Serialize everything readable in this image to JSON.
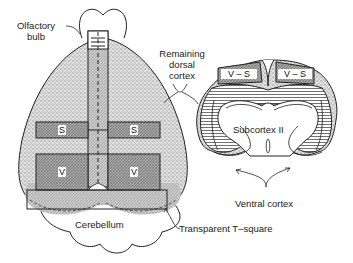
{
  "figure": {
    "left_view": {
      "labels": {
        "olfactory_bulb_line1": "Olfactory",
        "olfactory_bulb_line2": "bulb",
        "cerebellum": "Cerebellum",
        "transparent_t_square": "Transparent T–square"
      },
      "regions": {
        "s_left": "S",
        "s_right": "S",
        "v_left": "V",
        "v_right": "V"
      }
    },
    "shared_labels": {
      "remaining_dorsal_cortex_line1": "Remaining",
      "remaining_dorsal_cortex_line2": "dorsal",
      "remaining_dorsal_cortex_line3": "cortex"
    },
    "right_view": {
      "labels": {
        "subcortex": "Subcortex II",
        "ventral_cortex": "Ventral cortex"
      },
      "regions": {
        "vs_left": "V – S",
        "vs_right": "V – S"
      }
    },
    "colors": {
      "outline": "#222222",
      "stipple": "#cfcfcf",
      "crosshatch": "#9a9a9a",
      "hatch_lines": "#444444",
      "background": "#ffffff"
    }
  }
}
